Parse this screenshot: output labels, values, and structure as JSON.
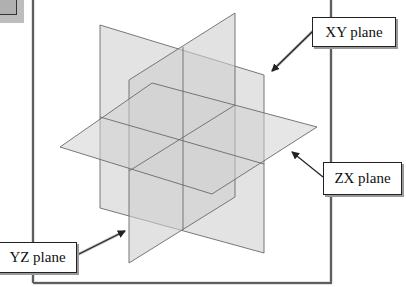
{
  "figure": {
    "type": "coordinate-planes-diagram",
    "colors": {
      "plane_fill": "#d6d6d6",
      "plane_edge": "#6a6a6a",
      "frame": "#444444",
      "label_border": "#222222",
      "label_shadow": "#9a9a9a",
      "corner_thumb": "#bdbdbd"
    },
    "labels": [
      {
        "id": "xy",
        "text": "XY plane"
      },
      {
        "id": "zx",
        "text": "ZX plane"
      },
      {
        "id": "yz",
        "text": "YZ plane"
      }
    ],
    "planes": [
      {
        "name": "XY plane",
        "points": [
          [
            100,
            25
          ],
          [
            264,
            75
          ],
          [
            264,
            253
          ],
          [
            100,
            208
          ]
        ]
      },
      {
        "name": "YZ plane",
        "points": [
          [
            129,
            80
          ],
          [
            235,
            13
          ],
          [
            235,
            197
          ],
          [
            129,
            263
          ]
        ]
      },
      {
        "name": "ZX plane",
        "points": [
          [
            60,
            147
          ],
          [
            152,
            83
          ],
          [
            317,
            127
          ],
          [
            212,
            194
          ]
        ]
      }
    ]
  }
}
